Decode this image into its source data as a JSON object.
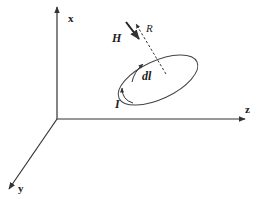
{
  "diagram": {
    "colors": {
      "stroke": "#333333",
      "background": "#ffffff"
    },
    "axes": {
      "x_label": "x",
      "y_label": "y",
      "z_label": "z"
    },
    "labels": {
      "field": "H",
      "distance": "R",
      "element": "dl",
      "current": "I"
    },
    "elements": [
      {
        "id": "x-axis",
        "type": "arrow",
        "label": "x"
      },
      {
        "id": "y-axis",
        "type": "arrow",
        "label": "y"
      },
      {
        "id": "z-axis",
        "type": "arrow",
        "label": "z"
      },
      {
        "id": "current-loop",
        "type": "ellipse",
        "label": "dl"
      },
      {
        "id": "distance-line",
        "type": "dashed-arrow",
        "label": "R"
      },
      {
        "id": "field-arrow",
        "type": "arrow",
        "label": "H"
      },
      {
        "id": "current-arrow",
        "type": "curved-arrow",
        "label": "I"
      }
    ]
  }
}
